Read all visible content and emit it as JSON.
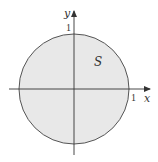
{
  "diagram": {
    "region_label": "S",
    "x_axis_label": "x",
    "y_axis_label": "y",
    "x_tick_label": "1",
    "y_tick_label": "1",
    "region_fill": "#e8e8e8",
    "stroke_color": "#555555"
  }
}
